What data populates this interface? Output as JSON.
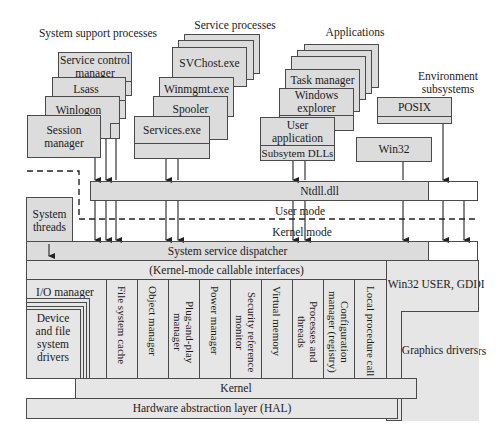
{
  "captions": {
    "system_support": "System support processes",
    "service_processes": "Service processes",
    "applications": "Applications",
    "environment_subsystems": "Environment subsystems"
  },
  "system_support": {
    "items": [
      "Service control manager",
      "Lsass",
      "Winlogon",
      "Session manager"
    ]
  },
  "service_processes": {
    "items": [
      "SVChost.exe",
      "Winmgmt.exe",
      "Spooler",
      "Services.exe"
    ]
  },
  "applications": {
    "items": [
      "Task manager",
      "Windows explorer",
      "User application"
    ],
    "dll_label": "Subsytem DLLs"
  },
  "environment_subsystems": {
    "items": [
      "POSIX",
      "Win32"
    ]
  },
  "ntdll": "Ntdll.dll",
  "system_threads": "System threads",
  "modes": {
    "user": "User mode",
    "kernel": "Kernel mode"
  },
  "dispatcher": "System service dispatcher",
  "callable": "(Kernel-mode callable interfaces)",
  "io_manager": "I/O manager",
  "drivers": "Device and file system drivers",
  "executive": [
    "File system cache",
    "Object manager",
    "Plug-and-play manager",
    "Power manager",
    "Security reference monitor",
    "Virtual memory",
    "Processes and threads",
    "Configuration manager (registry)",
    "Local procedure call"
  ],
  "win32_user_gdi": "Win32 USER, GDI",
  "graphics_drivers": "Graphics drivers",
  "kernel": "Kernel",
  "hal": "Hardware abstraction layer (HAL)",
  "colors": {
    "box_fill": "#dcdcdc",
    "border": "#4a4a4a",
    "background": "#ffffff"
  }
}
